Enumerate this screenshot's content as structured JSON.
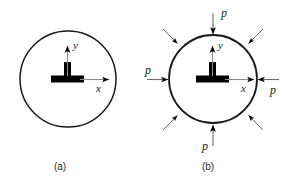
{
  "figure": {
    "background_color": "#ffffff",
    "stroke_color": "#1a1a1a",
    "fill_color": "#000000",
    "panels": [
      {
        "id": "panel-a",
        "caption": "(a)",
        "description": "unloaded circular ring cross-section with origin axes",
        "circle": {
          "cx": 68,
          "cy": 79,
          "r": 48
        },
        "axes": {
          "x_label": "x",
          "y_label": "y",
          "z_marker": "out-of-plane-bar"
        },
        "loads": []
      },
      {
        "id": "panel-b",
        "caption": "(b)",
        "description": "circular ring loaded by uniform external pressure p",
        "circle": {
          "cx": 213,
          "cy": 79,
          "r": 44
        },
        "axes": {
          "x_label": "x",
          "y_label": "y",
          "z_marker": "out-of-plane-bar"
        },
        "loads": [
          {
            "position": "top",
            "angle_deg": 90,
            "label": "p"
          },
          {
            "position": "right",
            "angle_deg": 0,
            "label": "p"
          },
          {
            "position": "bottom",
            "angle_deg": 270,
            "label": "p"
          },
          {
            "position": "left",
            "angle_deg": 180,
            "label": "p"
          },
          {
            "position": "top-right",
            "angle_deg": 45,
            "label": ""
          },
          {
            "position": "top-left",
            "angle_deg": 135,
            "label": ""
          },
          {
            "position": "bottom-left",
            "angle_deg": 225,
            "label": ""
          },
          {
            "position": "bottom-right",
            "angle_deg": 315,
            "label": ""
          }
        ]
      }
    ]
  }
}
